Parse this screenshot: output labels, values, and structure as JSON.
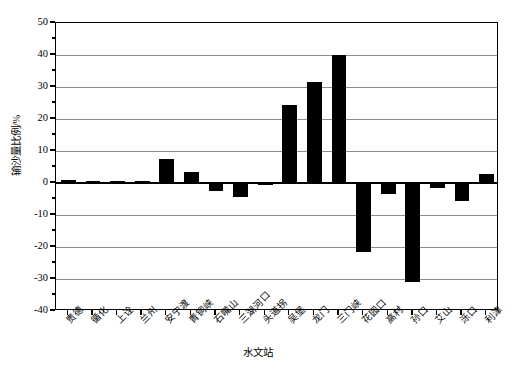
{
  "chart_data": {
    "type": "bar",
    "title": "",
    "xlabel": "水文站",
    "ylabel": "输沙量比例/%",
    "ylim": [
      -40,
      50
    ],
    "ytick_step": 10,
    "yticks": [
      50,
      40,
      30,
      20,
      10,
      0,
      -10,
      -20,
      -30,
      -40
    ],
    "ytick_labels": [
      "50",
      "40",
      "30",
      "20",
      "10",
      "0",
      "-10",
      "-20",
      "-30",
      "-40"
    ],
    "grid": "horizontal",
    "legend": "none",
    "bar_color": "#000000",
    "categories": [
      "贵德",
      "循化",
      "上诠",
      "兰州",
      "安宁渡",
      "青铜峡",
      "石嘴山",
      "三湖河口",
      "头道拐",
      "吴堡",
      "龙门",
      "三门峡",
      "花园口",
      "高村",
      "孙口",
      "艾山",
      "泺口",
      "利津"
    ],
    "values": [
      0.8,
      0.2,
      0.3,
      0.3,
      7.5,
      3.5,
      -2.5,
      -4.5,
      -0.5,
      24.3,
      31.5,
      40.0,
      -21.5,
      -3.5,
      -31.0,
      -1.5,
      -5.5,
      2.8
    ]
  }
}
